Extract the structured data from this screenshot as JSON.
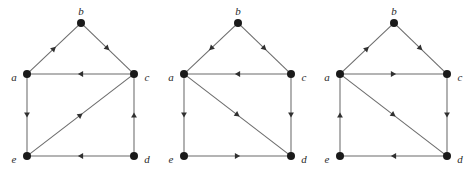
{
  "figure": {
    "background_color": "#ffffff",
    "node_color": "#1a1a1a",
    "edge_color": "#6b6b6b",
    "arrow_color": "#303030",
    "label_color": "#2a2a2a",
    "node_radius": 4,
    "graph_count": 3
  },
  "labels": {
    "a": "a",
    "b": "b",
    "c": "c",
    "d": "d",
    "e": "e"
  },
  "graphs": [
    {
      "id": "graph-1",
      "origin_x": 0,
      "nodes": [
        {
          "id": "a",
          "label": "a",
          "x": 27,
          "y": 74,
          "label_x": 14,
          "label_y": 78,
          "label_anchor": "middle"
        },
        {
          "id": "b",
          "label": "b",
          "x": 81,
          "y": 23,
          "label_x": 81,
          "label_y": 12,
          "label_anchor": "middle"
        },
        {
          "id": "c",
          "label": "c",
          "x": 134,
          "y": 74,
          "label_x": 147,
          "label_y": 78,
          "label_anchor": "middle"
        },
        {
          "id": "d",
          "label": "d",
          "x": 134,
          "y": 156,
          "label_x": 147,
          "label_y": 160,
          "label_anchor": "middle"
        },
        {
          "id": "e",
          "label": "e",
          "x": 27,
          "y": 156,
          "label_x": 14,
          "label_y": 160,
          "label_anchor": "middle"
        }
      ],
      "edges": [
        {
          "from": "a",
          "to": "b",
          "direction": "a->b"
        },
        {
          "from": "b",
          "to": "c",
          "direction": "b->c"
        },
        {
          "from": "c",
          "to": "a",
          "direction": "c->a"
        },
        {
          "from": "a",
          "to": "e",
          "direction": "a->e"
        },
        {
          "from": "e",
          "to": "c",
          "direction": "e->c"
        },
        {
          "from": "d",
          "to": "c",
          "direction": "d->c"
        },
        {
          "from": "d",
          "to": "e",
          "direction": "d->e"
        }
      ]
    },
    {
      "id": "graph-2",
      "origin_x": 157,
      "nodes": [
        {
          "id": "a",
          "label": "a",
          "x": 27,
          "y": 74,
          "label_x": 14,
          "label_y": 78,
          "label_anchor": "middle"
        },
        {
          "id": "b",
          "label": "b",
          "x": 81,
          "y": 23,
          "label_x": 81,
          "label_y": 12,
          "label_anchor": "middle"
        },
        {
          "id": "c",
          "label": "c",
          "x": 134,
          "y": 74,
          "label_x": 147,
          "label_y": 78,
          "label_anchor": "middle"
        },
        {
          "id": "d",
          "label": "d",
          "x": 134,
          "y": 156,
          "label_x": 147,
          "label_y": 160,
          "label_anchor": "middle"
        },
        {
          "id": "e",
          "label": "e",
          "x": 27,
          "y": 156,
          "label_x": 14,
          "label_y": 160,
          "label_anchor": "middle"
        }
      ],
      "edges": [
        {
          "from": "b",
          "to": "a",
          "direction": "b->a"
        },
        {
          "from": "b",
          "to": "c",
          "direction": "b->c"
        },
        {
          "from": "c",
          "to": "a",
          "direction": "c->a"
        },
        {
          "from": "a",
          "to": "e",
          "direction": "a->e"
        },
        {
          "from": "a",
          "to": "d",
          "direction": "a->d"
        },
        {
          "from": "c",
          "to": "d",
          "direction": "c->d"
        },
        {
          "from": "e",
          "to": "d",
          "direction": "e->d"
        }
      ]
    },
    {
      "id": "graph-3",
      "origin_x": 313,
      "nodes": [
        {
          "id": "a",
          "label": "a",
          "x": 27,
          "y": 74,
          "label_x": 14,
          "label_y": 78,
          "label_anchor": "middle"
        },
        {
          "id": "b",
          "label": "b",
          "x": 81,
          "y": 23,
          "label_x": 81,
          "label_y": 12,
          "label_anchor": "middle"
        },
        {
          "id": "c",
          "label": "c",
          "x": 134,
          "y": 74,
          "label_x": 147,
          "label_y": 78,
          "label_anchor": "middle"
        },
        {
          "id": "d",
          "label": "d",
          "x": 134,
          "y": 156,
          "label_x": 147,
          "label_y": 160,
          "label_anchor": "middle"
        },
        {
          "id": "e",
          "label": "e",
          "x": 27,
          "y": 156,
          "label_x": 14,
          "label_y": 160,
          "label_anchor": "middle"
        }
      ],
      "edges": [
        {
          "from": "a",
          "to": "b",
          "direction": "a->b"
        },
        {
          "from": "b",
          "to": "c",
          "direction": "b->c"
        },
        {
          "from": "a",
          "to": "c",
          "direction": "a->c"
        },
        {
          "from": "e",
          "to": "a",
          "direction": "e->a"
        },
        {
          "from": "a",
          "to": "d",
          "direction": "a->d"
        },
        {
          "from": "c",
          "to": "d",
          "direction": "c->d"
        },
        {
          "from": "d",
          "to": "e",
          "direction": "d->e"
        }
      ]
    }
  ]
}
